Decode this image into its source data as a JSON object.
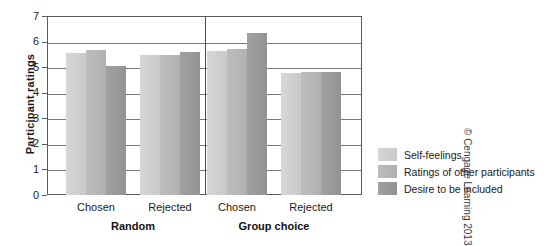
{
  "chart_data": {
    "type": "bar",
    "title": "",
    "xlabel": "",
    "ylabel": "Participant ratings",
    "ylim": [
      0,
      7
    ],
    "yticks": [
      "0",
      "1",
      "2",
      "3",
      "4",
      "5",
      "6",
      "7"
    ],
    "grid": true,
    "legend_position": "right",
    "categories": [
      "Chosen",
      "Rejected",
      "Chosen",
      "Rejected"
    ],
    "group_labels": [
      "Random",
      "Group choice"
    ],
    "groups": [
      {
        "label": "Random",
        "categories": [
          "Chosen",
          "Rejected"
        ]
      },
      {
        "label": "Group choice",
        "categories": [
          "Chosen",
          "Rejected"
        ]
      }
    ],
    "series": [
      {
        "name": "Self-feelings",
        "color": "#cfcfcf",
        "values": [
          5.55,
          5.47,
          5.63,
          4.77
        ]
      },
      {
        "name": "Ratings of other participants",
        "color": "#b7b7b7",
        "values": [
          5.67,
          5.47,
          5.71,
          4.81
        ]
      },
      {
        "name": "Desire to be included",
        "color": "#9a9a9a",
        "values": [
          5.04,
          5.59,
          6.33,
          4.81
        ]
      }
    ]
  },
  "axis": {
    "y_title": "Participant ratings",
    "y_ticks": [
      "7",
      "6",
      "5",
      "4",
      "3",
      "2",
      "1",
      "0"
    ],
    "x_tick_labels": [
      "Chosen",
      "Rejected",
      "Chosen",
      "Rejected"
    ],
    "x_group_labels": [
      "Random",
      "Group choice"
    ]
  },
  "legend": {
    "items": [
      {
        "label": "Self-feelings",
        "color": "#cfcfcf"
      },
      {
        "label": "Ratings of other participants",
        "color": "#b7b7b7"
      },
      {
        "label": "Desire to be included",
        "color": "#9a9a9a"
      }
    ]
  },
  "credit": {
    "text": "© Cengage Learning 2013"
  }
}
